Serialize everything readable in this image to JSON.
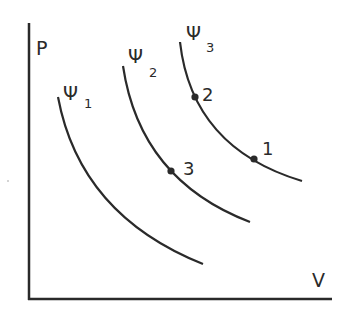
{
  "diagram": {
    "type": "P-V isotherm diagram",
    "axes": {
      "y_label": "P",
      "x_label": "V"
    },
    "curves": [
      {
        "name": "Ψ1",
        "symbol": "Ψ",
        "subscript": "1"
      },
      {
        "name": "Ψ2",
        "symbol": "Ψ",
        "subscript": "2"
      },
      {
        "name": "Ψ3",
        "symbol": "Ψ",
        "subscript": "3"
      }
    ],
    "points": [
      {
        "label": "1",
        "on_curve": "Ψ3"
      },
      {
        "label": "2",
        "on_curve": "Ψ3"
      },
      {
        "label": "3",
        "on_curve": "Ψ2"
      }
    ],
    "colors": {
      "line": "#2a2a2a",
      "background": "#ffffff"
    }
  }
}
